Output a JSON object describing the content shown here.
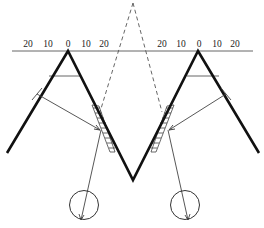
{
  "diagram": {
    "type": "optical-viewing-geometry",
    "colors": {
      "stroke": "#111111",
      "thin_stroke": "#555555",
      "background": "#ffffff"
    },
    "scales": [
      {
        "id": "left-scale",
        "ticks": [
          "20",
          "10",
          "0",
          "10",
          "20"
        ]
      },
      {
        "id": "right-scale",
        "ticks": [
          "20",
          "10",
          "0",
          "10",
          "20"
        ]
      }
    ],
    "elements": {
      "baseline": "horizontal reference line",
      "surface": "thick W-shaped profile",
      "virtual_apex": "dashed lines meeting above",
      "hatched_zones": 2,
      "eyes": 2
    }
  }
}
